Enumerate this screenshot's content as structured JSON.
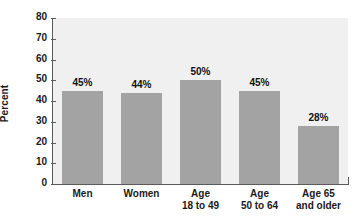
{
  "chart_data": {
    "type": "bar",
    "title": "",
    "subtitle": "",
    "xlabel": "",
    "ylabel": "Percent",
    "ylim": [
      0,
      80
    ],
    "yticks": [
      0,
      10,
      20,
      30,
      40,
      50,
      60,
      70,
      80
    ],
    "ytick_labels": [
      "0",
      "10",
      "20",
      "30",
      "40",
      "50",
      "60",
      "70",
      "80"
    ],
    "grid": false,
    "legend": null,
    "categories": [
      "Men",
      "Women",
      "Age 18 to 49",
      "Age 50 to 64",
      "Age 65 and older"
    ],
    "category_lines": [
      [
        "Men",
        ""
      ],
      [
        "Women",
        ""
      ],
      [
        "Age",
        "18 to 49"
      ],
      [
        "Age",
        "50 to 64"
      ],
      [
        "Age 65",
        "and older"
      ]
    ],
    "values": [
      45,
      44,
      50,
      45,
      28
    ],
    "data_labels": [
      "45%",
      "44%",
      "50%",
      "45%",
      "28%"
    ],
    "colors": {
      "bar_fill": "#a3a3a3",
      "plot_background": "#f0f0f0",
      "page_background": "#ffffff",
      "axis_line": "#5a5a5a",
      "text": "#1a1a1a"
    }
  }
}
